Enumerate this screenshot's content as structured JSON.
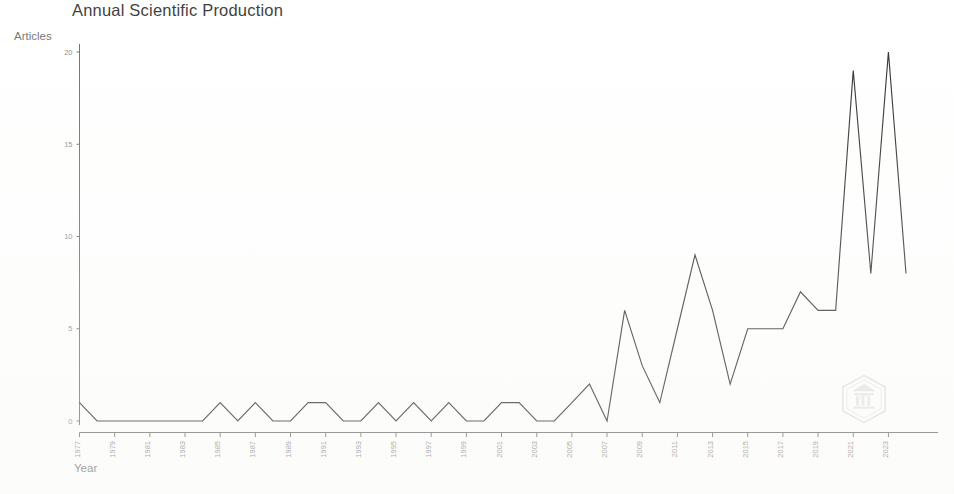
{
  "chart_title": "Annual Scientific Production",
  "partial_title_above": "",
  "axis": {
    "y_label": "Articles",
    "x_label": "Year",
    "y_ticks": [
      0,
      5,
      10,
      15,
      20
    ],
    "x_ticks": [
      1977,
      1979,
      1981,
      1983,
      1985,
      1987,
      1989,
      1991,
      1993,
      1995,
      1997,
      1999,
      2001,
      2003,
      2005,
      2007,
      2009,
      2011,
      2013,
      2015,
      2017,
      2019,
      2021,
      2023
    ]
  },
  "watermark": {
    "name": "hexagon-institutional-logo"
  },
  "chart_data": {
    "type": "line",
    "title": "Annual Scientific Production",
    "xlabel": "Year",
    "ylabel": "Articles",
    "ylim": [
      0,
      20
    ],
    "xlim": [
      1977,
      2024
    ],
    "grid": false,
    "legend": "none",
    "x": [
      1977,
      1978,
      1979,
      1980,
      1981,
      1982,
      1983,
      1984,
      1985,
      1986,
      1987,
      1988,
      1989,
      1990,
      1991,
      1992,
      1993,
      1994,
      1995,
      1996,
      1997,
      1998,
      1999,
      2000,
      2001,
      2002,
      2003,
      2004,
      2005,
      2006,
      2007,
      2008,
      2009,
      2010,
      2011,
      2012,
      2013,
      2014,
      2015,
      2016,
      2017,
      2018,
      2019,
      2020,
      2021,
      2022,
      2023,
      2024
    ],
    "values": [
      1,
      0,
      0,
      0,
      0,
      0,
      0,
      0,
      1,
      0,
      1,
      0,
      0,
      1,
      1,
      0,
      0,
      1,
      0,
      1,
      0,
      1,
      0,
      0,
      1,
      1,
      0,
      0,
      1,
      2,
      0,
      6,
      3,
      1,
      5,
      9,
      6,
      2,
      5,
      5,
      5,
      7,
      6,
      6,
      19,
      8,
      20,
      8
    ],
    "series": [
      {
        "name": "Articles",
        "color": "#2f2f2f",
        "values": [
          1,
          0,
          0,
          0,
          0,
          0,
          0,
          0,
          1,
          0,
          1,
          0,
          0,
          1,
          1,
          0,
          0,
          1,
          0,
          1,
          0,
          1,
          0,
          0,
          1,
          1,
          0,
          0,
          1,
          2,
          0,
          6,
          3,
          1,
          5,
          9,
          6,
          2,
          5,
          5,
          5,
          7,
          6,
          6,
          19,
          8,
          20,
          8
        ]
      }
    ]
  }
}
